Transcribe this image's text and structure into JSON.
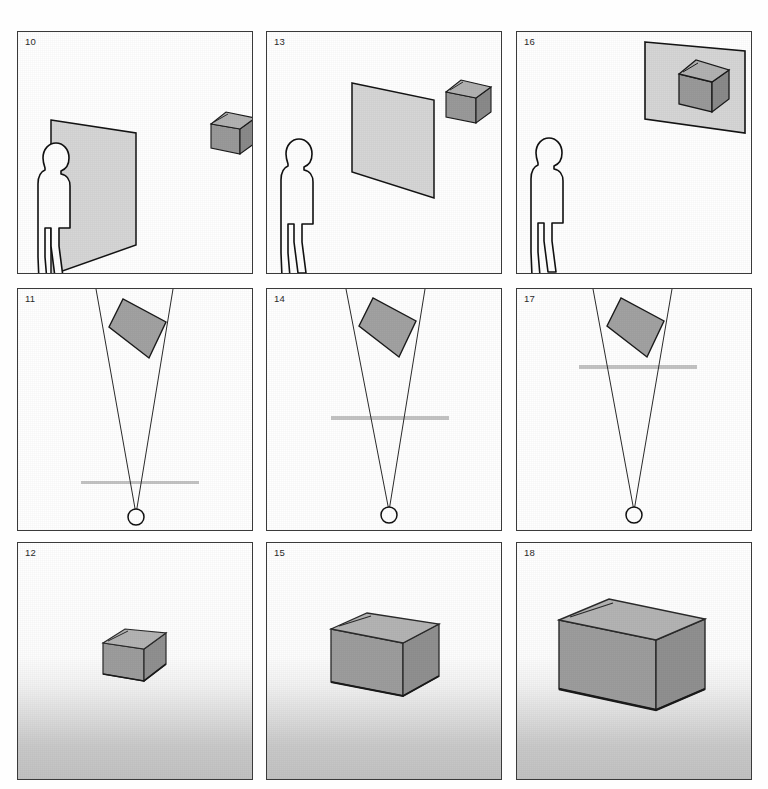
{
  "figure": {
    "type": "multi-panel-diagram",
    "columns": 3,
    "rows": 3,
    "background_color": "#ffffff",
    "panel_border_color": "#3a3a3a"
  },
  "palette": {
    "plane_fill": "#d6d6d6",
    "plane_stroke": "#1a1a1a",
    "box_top_fill": "#b4b4b4",
    "box_front_fill": "#9a9a9a",
    "box_side_fill": "#8d8d8d",
    "box_stroke": "#1a1a1a",
    "figure_fill": "#ffffff",
    "figure_stroke": "#111111",
    "cone_stroke": "#2b2b2b",
    "eye_stroke": "#111111",
    "retina_line": "#c3c3c3",
    "rect_fill": "#a2a2a2",
    "number_color": "#2b2b2b"
  },
  "panels": [
    {
      "id": "panel-10",
      "number": "10",
      "row": 1,
      "column": 1,
      "scene": "observer-with-near-plane-and-box",
      "background": "plain",
      "elements": [
        "human-silhouette",
        "tilted-plane",
        "small-box"
      ],
      "caption_note": "Observer stands beside a large near plane; box floats upper right"
    },
    {
      "id": "panel-13",
      "number": "13",
      "row": 1,
      "column": 2,
      "scene": "observer-with-mid-plane-and-box",
      "background": "plain",
      "elements": [
        "human-silhouette",
        "tilted-plane",
        "small-box"
      ],
      "caption_note": "Plane moved away from observer toward the box"
    },
    {
      "id": "panel-16",
      "number": "16",
      "row": 1,
      "column": 3,
      "scene": "observer-with-far-plane-at-box",
      "background": "plain",
      "elements": [
        "human-silhouette",
        "tilted-plane",
        "small-box"
      ],
      "caption_note": "Plane has reached the box at the far distance"
    },
    {
      "id": "panel-11",
      "number": "11",
      "row": 2,
      "column": 1,
      "scene": "eye-visual-cone-near-image-plane",
      "background": "plain",
      "elements": [
        "eye-circle",
        "visual-cone",
        "tilted-rectangle",
        "retina-line"
      ],
      "retina_line_position": "low",
      "caption_note": "Visual cone from eye to target rectangle; section line close to the eye"
    },
    {
      "id": "panel-14",
      "number": "14",
      "row": 2,
      "column": 2,
      "scene": "eye-visual-cone-mid-image-plane",
      "background": "plain",
      "elements": [
        "eye-circle",
        "visual-cone",
        "tilted-rectangle",
        "retina-line"
      ],
      "retina_line_position": "middle",
      "caption_note": "Section line midway along the visual cone"
    },
    {
      "id": "panel-17",
      "number": "17",
      "row": 2,
      "column": 3,
      "scene": "eye-visual-cone-far-image-plane",
      "background": "plain",
      "elements": [
        "eye-circle",
        "visual-cone",
        "tilted-rectangle",
        "retina-line"
      ],
      "retina_line_position": "high",
      "caption_note": "Section line near the target rectangle"
    },
    {
      "id": "panel-12",
      "number": "12",
      "row": 3,
      "column": 1,
      "scene": "small-box-on-graded-ground",
      "background": "gradient-ground",
      "elements": [
        "box",
        "ground-gradient"
      ],
      "box_relative_size": "small",
      "caption_note": "Box rendered small against a receding graded ground"
    },
    {
      "id": "panel-15",
      "number": "15",
      "row": 3,
      "column": 2,
      "scene": "medium-box-on-graded-ground",
      "background": "gradient-ground",
      "elements": [
        "box",
        "ground-gradient"
      ],
      "box_relative_size": "medium",
      "caption_note": "Same box rendered at medium size"
    },
    {
      "id": "panel-18",
      "number": "18",
      "row": 3,
      "column": 3,
      "scene": "large-box-on-graded-ground",
      "background": "gradient-ground",
      "elements": [
        "box",
        "ground-gradient"
      ],
      "box_relative_size": "large",
      "caption_note": "Same box rendered large, filling much of the frame"
    }
  ]
}
